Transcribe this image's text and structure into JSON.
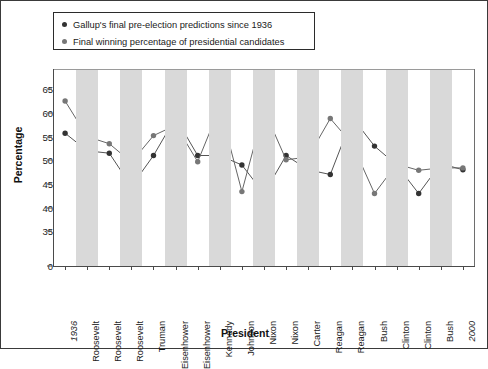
{
  "legend": {
    "items": [
      {
        "label": "Gallup's final pre-election predictions since 1936",
        "color": "#333333"
      },
      {
        "label": "Final winning percentage of presidential candidates",
        "color": "#777777"
      }
    ]
  },
  "chart_data": {
    "type": "line",
    "title": "",
    "xlabel": "President",
    "ylabel": "Percentage",
    "ylim": [
      33,
      67
    ],
    "yticks": [
      0,
      35,
      40,
      45,
      50,
      55,
      60,
      65
    ],
    "ytick_labels": [
      "0",
      "35",
      "40",
      "45",
      "50",
      "55",
      "60",
      "65"
    ],
    "axis_break_below": 35,
    "grid": false,
    "background_stripes": true,
    "legend_position": "top-left",
    "categories": [
      "1936",
      "Roosevelt",
      "Roosevelt",
      "Roosevelt",
      "Truman",
      "Eisenhower",
      "Eisenhower",
      "Kennedy",
      "Johnson",
      "Nixon",
      "Nixon",
      "Carter",
      "Reagan",
      "Reagan",
      "Bush",
      "Clinton",
      "Clinton",
      "Bush",
      "2000"
    ],
    "year_labels": [
      "1936",
      "2000"
    ],
    "series": [
      {
        "name": "Gallup's final pre-election predictions since 1936",
        "color": "#333333",
        "values": [
          55.7,
          52.0,
          51.5,
          44.5,
          51.0,
          59.0,
          51.0,
          51.0,
          49.0,
          43.0,
          51.0,
          48.0,
          47.0,
          59.0,
          53.0,
          49.0,
          43.0,
          49.3,
          48.0
        ]
      },
      {
        "name": "Final winning percentage of presidential candidates",
        "color": "#777777",
        "values": [
          62.5,
          55.0,
          53.5,
          49.6,
          55.2,
          57.4,
          49.7,
          61.1,
          43.4,
          60.7,
          50.1,
          50.7,
          58.8,
          53.4,
          43.0,
          49.2,
          47.9,
          48.4,
          48.4
        ]
      }
    ],
    "series_pairs": [
      {
        "category": "1936",
        "gallup": 55.7,
        "actual": 62.5
      },
      {
        "category": "Roosevelt",
        "gallup": 52.0,
        "actual": 55.0
      },
      {
        "category": "Roosevelt",
        "gallup": 51.5,
        "actual": 53.5
      },
      {
        "category": "Roosevelt",
        "gallup": 44.5,
        "actual": 49.6
      },
      {
        "category": "Truman",
        "gallup": 51.0,
        "actual": 55.2
      },
      {
        "category": "Eisenhower",
        "gallup": 59.0,
        "actual": 57.4
      },
      {
        "category": "Eisenhower",
        "gallup": 51.0,
        "actual": 49.7
      },
      {
        "category": "Kennedy",
        "gallup": 51.0,
        "actual": 61.1
      },
      {
        "category": "Johnson",
        "gallup": 49.0,
        "actual": 43.4
      },
      {
        "category": "Nixon",
        "gallup": 43.0,
        "actual": 60.7
      },
      {
        "category": "Nixon",
        "gallup": 51.0,
        "actual": 50.1
      },
      {
        "category": "Carter",
        "gallup": 48.0,
        "actual": 50.7
      },
      {
        "category": "Reagan",
        "gallup": 47.0,
        "actual": 58.8
      },
      {
        "category": "Reagan",
        "gallup": 59.0,
        "actual": 53.4
      },
      {
        "category": "Bush",
        "gallup": 53.0,
        "actual": 43.0
      },
      {
        "category": "Clinton",
        "gallup": 49.0,
        "actual": 49.2
      },
      {
        "category": "Clinton",
        "gallup": 43.0,
        "actual": 47.9
      },
      {
        "category": "Bush",
        "gallup": 49.3,
        "actual": 48.4
      },
      {
        "category": "2000",
        "gallup": 48.0,
        "actual": 48.4
      }
    ]
  }
}
